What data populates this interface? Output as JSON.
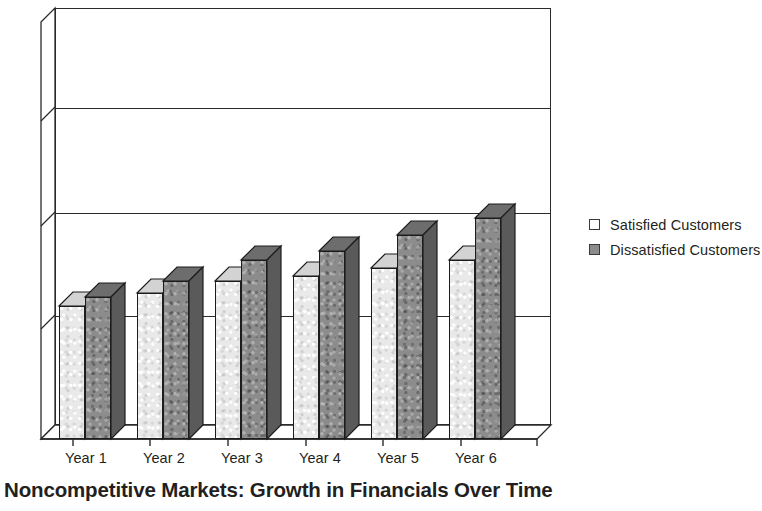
{
  "chart_data": {
    "type": "bar",
    "title": "Noncompetitive Markets: Growth in Financials Over Time",
    "xlabel": "",
    "ylabel": "",
    "categories": [
      "Year 1",
      "Year 2",
      "Year 3",
      "Year 4",
      "Year 5",
      "Year 6"
    ],
    "series": [
      {
        "name": "Satisfied Customers",
        "color": "#e9e9e9",
        "values": [
          32,
          35,
          38,
          39,
          41,
          43
        ]
      },
      {
        "name": "Dissatisfied Customers",
        "color": "#8c8c8c",
        "values": [
          34,
          38,
          43,
          45,
          49,
          53
        ]
      }
    ],
    "ylim": [
      0,
      100
    ],
    "y_gridline_values": [
      25,
      50,
      75,
      100
    ],
    "grid": true,
    "axis_tick_labels_visible": false,
    "legend_position": "right",
    "style": "3d-column",
    "frame_color": "#2b2b2b"
  },
  "legend": {
    "items": [
      {
        "label": "Satisfied Customers",
        "swatch": "white-square-icon"
      },
      {
        "label": "Dissatisfied Customers",
        "swatch": "gray-square-icon"
      }
    ]
  },
  "axis": {
    "x_tick_labels": [
      "Year 1",
      "Year 2",
      "Year 3",
      "Year 4",
      "Year 5",
      "Year 6"
    ]
  },
  "title": {
    "text": "Noncompetitive Markets: Growth in Financials Over Time"
  }
}
